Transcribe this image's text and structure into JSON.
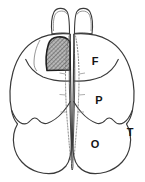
{
  "figure": {
    "background_color": "#ffffff",
    "line_color": "#3a3a3a",
    "label_color": "#151515",
    "shaded_region_fill": "#a8a8a8",
    "shaded_region_name": "hatched lesion area on left frontal lobe",
    "view": "dorsal (top-down)",
    "midline_style": "dotted"
  },
  "labels": [
    {
      "id": "frontal",
      "text": "F",
      "x": 95,
      "y": 62
    },
    {
      "id": "parietal",
      "text": "P",
      "x": 99,
      "y": 101
    },
    {
      "id": "occipital",
      "text": "O",
      "x": 95,
      "y": 145
    },
    {
      "id": "temporal",
      "text": "T",
      "x": 130,
      "y": 133
    }
  ],
  "structures": {
    "olfactory_bulb_left": "left olfactory bulb",
    "olfactory_bulb_right": "right olfactory bulb",
    "hemisphere_left": "left cerebral hemisphere",
    "hemisphere_right": "right cerebral hemisphere",
    "frontal_lobe": "frontal lobe",
    "parietal_lobe": "parietal lobe",
    "occipital_lobe": "occipital lobe",
    "temporal_pole": "temporal pole notch",
    "midline_fissure": "longitudinal fissure"
  }
}
